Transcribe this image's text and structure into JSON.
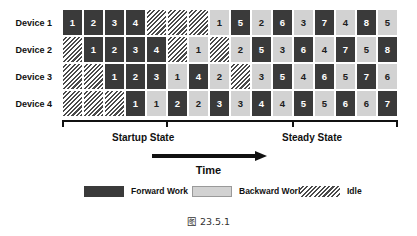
{
  "caption": "图 23.5.1",
  "axis": {
    "time_label": "Time",
    "startup_state_label": "Startup State",
    "steady_state_label": "Steady State"
  },
  "devices": [
    {
      "label": "Device 1"
    },
    {
      "label": "Device 2"
    },
    {
      "label": "Device 3"
    },
    {
      "label": "Device 4"
    }
  ],
  "legend": {
    "items": [
      {
        "label": "Forward Work",
        "type": "forward",
        "color": "#3a3a3a"
      },
      {
        "label": "Backward Work",
        "type": "backward",
        "color": "#d2d2d2"
      },
      {
        "label": "Idle",
        "type": "idle",
        "color": "hatched"
      }
    ]
  },
  "chart_data": {
    "type": "table",
    "xlabel": "Time",
    "ylabel": "",
    "num_columns": 16,
    "row_labels": [
      "Device 1",
      "Device 2",
      "Device 3",
      "Device 4"
    ],
    "cell_types": [
      "forward",
      "backward",
      "idle"
    ],
    "rows": [
      {
        "device": "Device 1",
        "cells": [
          {
            "type": "forward",
            "value": "1"
          },
          {
            "type": "forward",
            "value": "2"
          },
          {
            "type": "forward",
            "value": "3"
          },
          {
            "type": "forward",
            "value": "4"
          },
          {
            "type": "idle",
            "value": ""
          },
          {
            "type": "idle",
            "value": ""
          },
          {
            "type": "idle",
            "value": ""
          },
          {
            "type": "backward",
            "value": "1"
          },
          {
            "type": "forward",
            "value": "5"
          },
          {
            "type": "backward",
            "value": "2"
          },
          {
            "type": "forward",
            "value": "6"
          },
          {
            "type": "backward",
            "value": "3"
          },
          {
            "type": "forward",
            "value": "7"
          },
          {
            "type": "backward",
            "value": "4"
          },
          {
            "type": "forward",
            "value": "8"
          },
          {
            "type": "backward",
            "value": "5"
          }
        ]
      },
      {
        "device": "Device 2",
        "cells": [
          {
            "type": "idle",
            "value": ""
          },
          {
            "type": "forward",
            "value": "1"
          },
          {
            "type": "forward",
            "value": "2"
          },
          {
            "type": "forward",
            "value": "3"
          },
          {
            "type": "forward",
            "value": "4"
          },
          {
            "type": "idle",
            "value": ""
          },
          {
            "type": "backward",
            "value": "1"
          },
          {
            "type": "idle",
            "value": ""
          },
          {
            "type": "backward",
            "value": "2"
          },
          {
            "type": "forward",
            "value": "5"
          },
          {
            "type": "backward",
            "value": "3"
          },
          {
            "type": "forward",
            "value": "6"
          },
          {
            "type": "backward",
            "value": "4"
          },
          {
            "type": "forward",
            "value": "7"
          },
          {
            "type": "backward",
            "value": "5"
          },
          {
            "type": "forward",
            "value": "8"
          }
        ]
      },
      {
        "device": "Device 3",
        "cells": [
          {
            "type": "idle",
            "value": ""
          },
          {
            "type": "idle",
            "value": ""
          },
          {
            "type": "forward",
            "value": "1"
          },
          {
            "type": "forward",
            "value": "2"
          },
          {
            "type": "forward",
            "value": "3"
          },
          {
            "type": "backward",
            "value": "1"
          },
          {
            "type": "forward",
            "value": "4"
          },
          {
            "type": "backward",
            "value": "2"
          },
          {
            "type": "idle",
            "value": ""
          },
          {
            "type": "backward",
            "value": "3"
          },
          {
            "type": "forward",
            "value": "5"
          },
          {
            "type": "backward",
            "value": "4"
          },
          {
            "type": "forward",
            "value": "6"
          },
          {
            "type": "backward",
            "value": "5"
          },
          {
            "type": "forward",
            "value": "7"
          },
          {
            "type": "backward",
            "value": "6"
          }
        ]
      },
      {
        "device": "Device 4",
        "cells": [
          {
            "type": "idle",
            "value": ""
          },
          {
            "type": "idle",
            "value": ""
          },
          {
            "type": "idle",
            "value": ""
          },
          {
            "type": "forward",
            "value": "1"
          },
          {
            "type": "backward",
            "value": "1"
          },
          {
            "type": "forward",
            "value": "2"
          },
          {
            "type": "backward",
            "value": "2"
          },
          {
            "type": "forward",
            "value": "3"
          },
          {
            "type": "backward",
            "value": "3"
          },
          {
            "type": "forward",
            "value": "4"
          },
          {
            "type": "backward",
            "value": "4"
          },
          {
            "type": "forward",
            "value": "5"
          },
          {
            "type": "backward",
            "value": "5"
          },
          {
            "type": "forward",
            "value": "6"
          },
          {
            "type": "backward",
            "value": "6"
          },
          {
            "type": "forward",
            "value": "7"
          }
        ]
      }
    ]
  }
}
